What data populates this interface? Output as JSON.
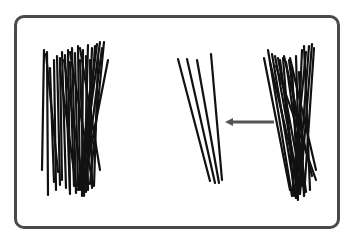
{
  "diagram": {
    "frame": {
      "x": 14,
      "y": 15,
      "width": 326,
      "height": 214,
      "border_color": "#4a4a4a",
      "radius": 10
    },
    "stick_color": "#111111",
    "arrow": {
      "from": [
        274,
        122
      ],
      "to": [
        225,
        122
      ],
      "color": "#555555",
      "direction": "left"
    },
    "groups": [
      {
        "name": "left-pile",
        "sticks": [
          [
            44,
            50,
            42,
            170
          ],
          [
            47,
            52,
            48,
            195
          ],
          [
            50,
            68,
            54,
            182
          ],
          [
            54,
            60,
            56,
            190
          ],
          [
            57,
            56,
            60,
            185
          ],
          [
            60,
            58,
            62,
            180
          ],
          [
            62,
            52,
            66,
            188
          ],
          [
            65,
            55,
            70,
            194
          ],
          [
            68,
            50,
            70,
            190
          ],
          [
            70,
            62,
            74,
            186
          ],
          [
            72,
            48,
            76,
            193
          ],
          [
            75,
            53,
            78,
            186
          ],
          [
            78,
            46,
            80,
            190
          ],
          [
            80,
            60,
            84,
            192
          ],
          [
            83,
            50,
            82,
            196
          ],
          [
            86,
            56,
            88,
            190
          ],
          [
            88,
            45,
            84,
            196
          ],
          [
            90,
            60,
            92,
            188
          ],
          [
            92,
            48,
            86,
            192
          ],
          [
            95,
            46,
            86,
            184
          ],
          [
            97,
            44,
            78,
            190
          ],
          [
            100,
            42,
            80,
            186
          ],
          [
            102,
            48,
            84,
            188
          ],
          [
            104,
            42,
            90,
            184
          ],
          [
            108,
            60,
            86,
            172
          ],
          [
            98,
            58,
            94,
            186
          ],
          [
            60,
            70,
            76,
            186
          ],
          [
            46,
            54,
            58,
            172
          ],
          [
            70,
            52,
            92,
            180
          ],
          [
            80,
            48,
            100,
            170
          ],
          [
            64,
            60,
            82,
            176
          ]
        ]
      },
      {
        "name": "removed-sticks",
        "sticks": [
          [
            178,
            59,
            210,
            181
          ],
          [
            187,
            59,
            215,
            183
          ],
          [
            197,
            60,
            219,
            183
          ],
          [
            211,
            54,
            222,
            180
          ]
        ]
      },
      {
        "name": "right-pile",
        "sticks": [
          [
            264,
            58,
            290,
            190
          ],
          [
            268,
            50,
            292,
            196
          ],
          [
            272,
            54,
            296,
            198
          ],
          [
            275,
            56,
            300,
            194
          ],
          [
            278,
            58,
            302,
            186
          ],
          [
            280,
            60,
            298,
            200
          ],
          [
            283,
            58,
            294,
            196
          ],
          [
            286,
            62,
            304,
            190
          ],
          [
            289,
            60,
            306,
            192
          ],
          [
            292,
            66,
            298,
            198
          ],
          [
            296,
            56,
            300,
            190
          ],
          [
            299,
            72,
            304,
            196
          ],
          [
            302,
            50,
            296,
            198
          ],
          [
            304,
            46,
            310,
            190
          ],
          [
            306,
            52,
            292,
            194
          ],
          [
            309,
            46,
            298,
            192
          ],
          [
            312,
            44,
            300,
            194
          ],
          [
            314,
            48,
            304,
            196
          ],
          [
            276,
            66,
            316,
            180
          ],
          [
            284,
            56,
            312,
            176
          ],
          [
            290,
            58,
            316,
            170
          ],
          [
            270,
            62,
            298,
            182
          ]
        ]
      }
    ]
  }
}
